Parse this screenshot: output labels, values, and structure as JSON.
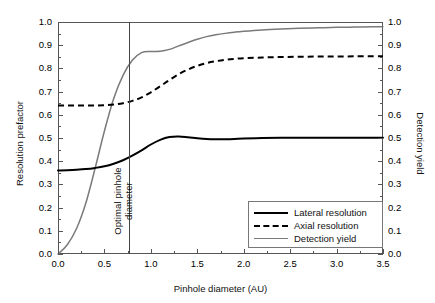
{
  "chart_data": {
    "type": "line",
    "title": "",
    "xlabel": "Pinhole diameter (AU)",
    "ylabel": "Resolution prefactor",
    "ylabel_right": "Detection yield",
    "xlim": [
      0.0,
      3.5
    ],
    "ylim": [
      0.0,
      1.0
    ],
    "ylim_right": [
      0.0,
      1.0
    ],
    "grid": false,
    "legend_position": "lower right",
    "xticks": [
      "0.0",
      "0.5",
      "1.0",
      "1.5",
      "2.0",
      "2.5",
      "3.0",
      "3.5"
    ],
    "xtick_values": [
      0.0,
      0.5,
      1.0,
      1.5,
      2.0,
      2.5,
      3.0,
      3.5
    ],
    "yticks": [
      "0.0",
      "0.1",
      "0.2",
      "0.3",
      "0.4",
      "0.5",
      "0.6",
      "0.7",
      "0.8",
      "0.9",
      "1.0"
    ],
    "ytick_values": [
      0.0,
      0.1,
      0.2,
      0.3,
      0.4,
      0.5,
      0.6,
      0.7,
      0.8,
      0.9,
      1.0
    ],
    "yticks_right": [
      "0.0",
      "0.1",
      "0.2",
      "0.3",
      "0.4",
      "0.5",
      "0.6",
      "0.7",
      "0.8",
      "0.9",
      "1.0"
    ],
    "ytick_values_right": [
      0.0,
      0.1,
      0.2,
      0.3,
      0.4,
      0.5,
      0.6,
      0.7,
      0.8,
      0.9,
      1.0
    ],
    "annotations": [
      {
        "name": "optimal-pinhole-diameter",
        "label": "Optimal pinhole\ndiameter",
        "label_line1": "Optimal pinhole",
        "label_line2": "diameter",
        "type": "vline",
        "x": 0.9
      }
    ],
    "series": [
      {
        "name": "Lateral resolution",
        "axis": "left",
        "color": "#000000",
        "style": "solid",
        "width": 2.0,
        "x": [
          0.0,
          0.1,
          0.2,
          0.3,
          0.4,
          0.5,
          0.6,
          0.7,
          0.8,
          0.9,
          1.0,
          1.1,
          1.2,
          1.3,
          1.4,
          1.5,
          1.6,
          1.7,
          1.8,
          1.9,
          2.0,
          2.2,
          2.4,
          2.6,
          2.8,
          3.0,
          3.2,
          3.4,
          3.5
        ],
        "y": [
          0.36,
          0.361,
          0.363,
          0.366,
          0.371,
          0.378,
          0.389,
          0.404,
          0.424,
          0.447,
          0.472,
          0.492,
          0.504,
          0.506,
          0.503,
          0.499,
          0.496,
          0.495,
          0.495,
          0.496,
          0.498,
          0.5,
          0.501,
          0.501,
          0.501,
          0.501,
          0.501,
          0.501,
          0.501
        ]
      },
      {
        "name": "Axial resolution",
        "axis": "left",
        "color": "#000000",
        "style": "dashed",
        "width": 2.0,
        "x": [
          0.0,
          0.1,
          0.2,
          0.3,
          0.4,
          0.5,
          0.6,
          0.7,
          0.8,
          0.9,
          1.0,
          1.1,
          1.2,
          1.3,
          1.4,
          1.5,
          1.6,
          1.7,
          1.8,
          1.9,
          2.0,
          2.2,
          2.4,
          2.6,
          2.8,
          3.0,
          3.2,
          3.4,
          3.5
        ],
        "y": [
          0.64,
          0.64,
          0.64,
          0.64,
          0.64,
          0.641,
          0.644,
          0.65,
          0.66,
          0.675,
          0.697,
          0.723,
          0.75,
          0.775,
          0.795,
          0.811,
          0.823,
          0.831,
          0.837,
          0.841,
          0.844,
          0.847,
          0.849,
          0.85,
          0.851,
          0.851,
          0.852,
          0.852,
          0.852
        ]
      },
      {
        "name": "Detection yield",
        "axis": "right",
        "color": "#7a7a7a",
        "style": "solid",
        "width": 1.5,
        "x": [
          0.0,
          0.1,
          0.2,
          0.3,
          0.4,
          0.5,
          0.6,
          0.7,
          0.8,
          0.9,
          1.0,
          1.1,
          1.2,
          1.3,
          1.4,
          1.5,
          1.6,
          1.7,
          1.8,
          1.9,
          2.0,
          2.2,
          2.4,
          2.6,
          2.8,
          3.0,
          3.2,
          3.4,
          3.5
        ],
        "y": [
          0.0,
          0.04,
          0.11,
          0.22,
          0.37,
          0.53,
          0.67,
          0.77,
          0.835,
          0.868,
          0.873,
          0.874,
          0.882,
          0.897,
          0.912,
          0.926,
          0.937,
          0.945,
          0.951,
          0.956,
          0.96,
          0.966,
          0.97,
          0.973,
          0.975,
          0.977,
          0.978,
          0.979,
          0.98
        ]
      }
    ]
  },
  "legend": {
    "items": [
      {
        "label": "Lateral resolution",
        "style": "solid-black"
      },
      {
        "label": "Axial resolution",
        "style": "dashed-black"
      },
      {
        "label": "Detection yield",
        "style": "solid-gray"
      }
    ]
  },
  "colors": {
    "lateral": "#000000",
    "axial": "#000000",
    "detection": "#7a7a7a",
    "frame": "#555555",
    "marker": "#444444",
    "background": "#ffffff"
  }
}
